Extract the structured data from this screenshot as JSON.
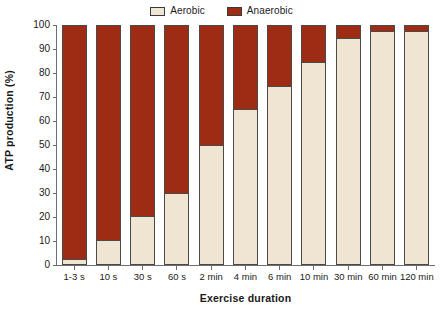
{
  "chart_data": {
    "type": "bar",
    "subtype": "stacked-percent",
    "title": "",
    "xlabel": "Exercise duration",
    "ylabel": "ATP production (%)",
    "ylim": [
      0,
      100
    ],
    "ytick_step": 10,
    "yticks": [
      100,
      90,
      80,
      70,
      60,
      50,
      40,
      30,
      20,
      10,
      0
    ],
    "grid": false,
    "legend_position": "top-center",
    "categories": [
      "1-3 s",
      "10 s",
      "30 s",
      "60 s",
      "2 min",
      "4 min",
      "6 min",
      "10 min",
      "30 min",
      "60 min",
      "120 min"
    ],
    "series": [
      {
        "name": "Aerobic",
        "color": "#f0e5d2",
        "values": [
          2,
          10,
          20,
          30,
          50,
          65,
          75,
          85,
          95,
          98,
          98
        ]
      },
      {
        "name": "Anaerobic",
        "color": "#9e2b14",
        "values": [
          98,
          90,
          80,
          70,
          50,
          35,
          25,
          15,
          5,
          2,
          2
        ]
      }
    ]
  },
  "legend": {
    "items": [
      {
        "label": "Aerobic",
        "swatch_color": "#f0e5d2"
      },
      {
        "label": "Anaerobic",
        "swatch_color": "#9e2b14"
      }
    ]
  },
  "axes": {
    "y": {
      "label": "ATP production (%)",
      "ticks": [
        "100",
        "90",
        "80",
        "70",
        "60",
        "50",
        "40",
        "30",
        "20",
        "10",
        "0"
      ]
    },
    "x": {
      "label": "Exercise duration",
      "ticks": [
        "1-3 s",
        "10 s",
        "30 s",
        "60 s",
        "2 min",
        "4 min",
        "6 min",
        "10 min",
        "30 min",
        "60 min",
        "120 min"
      ]
    }
  },
  "colors": {
    "aerobic": "#f0e5d2",
    "anaerobic": "#9e2b14",
    "axis": "#6e6e6e",
    "bar_outline": "#4a4a4a",
    "background": "#ffffff",
    "text": "#1a1a1a"
  }
}
